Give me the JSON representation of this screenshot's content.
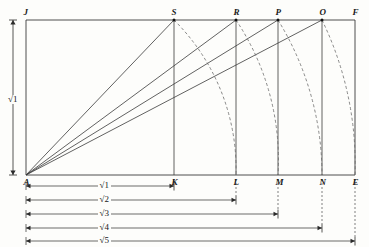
{
  "figure": {
    "type": "geometric-construction",
    "colors": {
      "line": "#3a3a3a",
      "dashed": "#6b6b6b",
      "dimension": "#2b2b2b",
      "background": "#fdfdfb"
    }
  },
  "points": {
    "top": [
      {
        "id": "J",
        "label": "J",
        "x": 26,
        "y": 20
      },
      {
        "id": "S",
        "label": "S",
        "x": 174,
        "y": 20
      },
      {
        "id": "R",
        "label": "R",
        "x": 236,
        "y": 20
      },
      {
        "id": "P",
        "label": "P",
        "x": 278,
        "y": 20
      },
      {
        "id": "O",
        "label": "O",
        "x": 322,
        "y": 20
      },
      {
        "id": "F",
        "label": "F",
        "x": 355,
        "y": 20
      }
    ],
    "bottom": [
      {
        "id": "A",
        "label": "A",
        "x": 26,
        "y": 175
      },
      {
        "id": "K",
        "label": "K",
        "x": 174,
        "y": 175
      },
      {
        "id": "L",
        "label": "L",
        "x": 236,
        "y": 175
      },
      {
        "id": "M",
        "label": "M",
        "x": 278,
        "y": 175
      },
      {
        "id": "N",
        "label": "N",
        "x": 322,
        "y": 175
      },
      {
        "id": "E",
        "label": "E",
        "x": 355,
        "y": 175
      }
    ]
  },
  "vertical_dimension": {
    "label": "√1",
    "x": 13,
    "y_top": 20,
    "y_bottom": 175,
    "label_y": 95
  },
  "rays": [
    {
      "from": "A",
      "to": "S"
    },
    {
      "from": "A",
      "to": "R"
    },
    {
      "from": "A",
      "to": "P"
    },
    {
      "from": "A",
      "to": "O"
    }
  ],
  "verticals": [
    {
      "at": "S",
      "x": 174
    },
    {
      "at": "R",
      "x": 236
    },
    {
      "at": "P",
      "x": 278
    },
    {
      "at": "O",
      "x": 322
    }
  ],
  "arcs": [
    {
      "from": "S",
      "to": "L",
      "radius": 210
    },
    {
      "from": "R",
      "to": "M",
      "radius": 252
    },
    {
      "from": "P",
      "to": "N",
      "radius": 296
    },
    {
      "from": "O",
      "to": "E",
      "radius": 329
    }
  ],
  "dimension_bars": [
    {
      "label": "√1",
      "x_start": 26,
      "x_end": 174,
      "y": 186
    },
    {
      "label": "√2",
      "x_start": 26,
      "x_end": 236,
      "y": 200
    },
    {
      "label": "√3",
      "x_start": 26,
      "x_end": 278,
      "y": 214
    },
    {
      "label": "√4",
      "x_start": 26,
      "x_end": 322,
      "y": 228
    },
    {
      "label": "√5",
      "x_start": 26,
      "x_end": 355,
      "y": 241
    }
  ],
  "chart_data": {
    "type": "scatter",
    "title": "",
    "xlabel": "",
    "ylabel": "",
    "categories": [
      "√1",
      "√2",
      "√3",
      "√4",
      "√5"
    ],
    "values": [
      1.0,
      1.414,
      1.732,
      2.0,
      2.236
    ],
    "note": "Lengths AK, AL, AM, AN, AE measured in units of AJ = AK = 1"
  }
}
